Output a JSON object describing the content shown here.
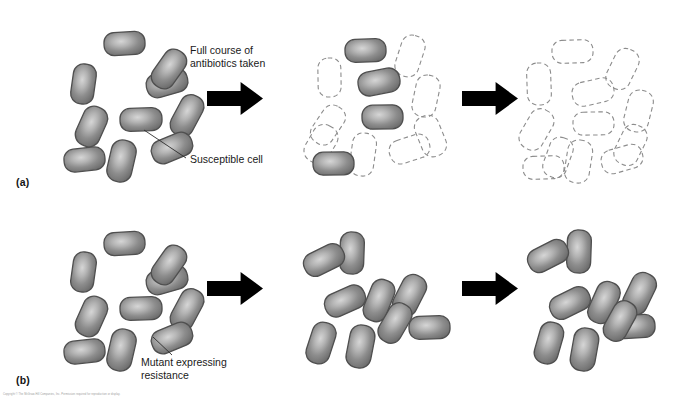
{
  "figure": {
    "width": 673,
    "height": 405,
    "background": "#ffffff",
    "credit_line": "Copyright © The McGraw-Hill Companies, Inc. Permission required for reproduction or display."
  },
  "colors": {
    "cell_fill_dark": "#6f6f6f",
    "cell_fill_light": "#c9c9c9",
    "cell_stroke": "#4f4f4f",
    "dead_cell_stroke": "#8c8c8c",
    "arrow_fill": "#000000",
    "leader_line": "#2b2b2b",
    "text": "#1a1a1a"
  },
  "labels": {
    "panel_a": "(a)",
    "panel_b": "(b)"
  },
  "captions": {
    "treatment": "Full course of\nantibiotics taken",
    "susceptible": "Susceptible cell",
    "mutant": "Mutant expressing\nresistance"
  },
  "icons": {
    "arrow": "right-arrow-icon",
    "live_cell": "bacterial-cell-icon",
    "dead_cell": "lysed-cell-outline-icon",
    "leader": "leader-line-icon"
  },
  "panels": [
    {
      "id": "a1",
      "row": "a",
      "stage": 1,
      "description": "Initial susceptible bacterial population",
      "live_count": 10,
      "dead_count": 0
    },
    {
      "id": "a2",
      "row": "a",
      "stage": 2,
      "description": "Most susceptible cells killed by antibiotic",
      "live_count": 4,
      "dead_count": 8
    },
    {
      "id": "a3",
      "row": "a",
      "stage": 3,
      "description": "Entire population eliminated",
      "live_count": 0,
      "dead_count": 12
    },
    {
      "id": "b1",
      "row": "b",
      "stage": 1,
      "description": "Population containing a resistant mutant",
      "live_count": 10,
      "dead_count": 0
    },
    {
      "id": "b2",
      "row": "b",
      "stage": 2,
      "description": "Resistant cells survive treatment",
      "live_count": 9,
      "dead_count": 0
    },
    {
      "id": "b3",
      "row": "b",
      "stage": 3,
      "description": "Resistant population regrows",
      "live_count": 9,
      "dead_count": 0
    }
  ],
  "cells": {
    "a1_live": [
      {
        "x": 104,
        "y": 32,
        "w": 41,
        "h": 23,
        "r": -3
      },
      {
        "x": 72,
        "y": 64,
        "w": 23,
        "h": 40,
        "r": 8
      },
      {
        "x": 146,
        "y": 71,
        "w": 42,
        "h": 24,
        "r": -16
      },
      {
        "x": 157,
        "y": 48,
        "w": 24,
        "h": 42,
        "r": 35
      },
      {
        "x": 175,
        "y": 94,
        "w": 24,
        "h": 43,
        "r": 28
      },
      {
        "x": 120,
        "y": 108,
        "w": 42,
        "h": 23,
        "r": -2
      },
      {
        "x": 79,
        "y": 106,
        "w": 25,
        "h": 41,
        "r": 24
      },
      {
        "x": 109,
        "y": 140,
        "w": 25,
        "h": 42,
        "r": 13
      },
      {
        "x": 64,
        "y": 148,
        "w": 41,
        "h": 23,
        "r": -6
      },
      {
        "x": 151,
        "y": 136,
        "w": 42,
        "h": 24,
        "r": -22
      }
    ],
    "a2_live": [
      {
        "x": 345,
        "y": 39,
        "w": 41,
        "h": 23,
        "r": -2
      },
      {
        "x": 358,
        "y": 70,
        "w": 42,
        "h": 24,
        "r": -11
      },
      {
        "x": 362,
        "y": 105,
        "w": 41,
        "h": 24,
        "r": -1
      },
      {
        "x": 313,
        "y": 152,
        "w": 41,
        "h": 23,
        "r": -1
      }
    ],
    "a2_dead": [
      {
        "x": 398,
        "y": 35,
        "w": 24,
        "h": 42,
        "r": 18
      },
      {
        "x": 318,
        "y": 58,
        "w": 23,
        "h": 39,
        "r": -1
      },
      {
        "x": 414,
        "y": 75,
        "w": 24,
        "h": 42,
        "r": 12
      },
      {
        "x": 316,
        "y": 104,
        "w": 24,
        "h": 42,
        "r": 34
      },
      {
        "x": 418,
        "y": 115,
        "w": 25,
        "h": 42,
        "r": -22
      },
      {
        "x": 351,
        "y": 133,
        "w": 24,
        "h": 43,
        "r": 8
      },
      {
        "x": 389,
        "y": 137,
        "w": 41,
        "h": 24,
        "r": -18
      },
      {
        "x": 308,
        "y": 124,
        "w": 26,
        "h": 40,
        "r": 30
      }
    ],
    "a3_dead": [
      {
        "x": 552,
        "y": 40,
        "w": 41,
        "h": 23,
        "r": -2
      },
      {
        "x": 610,
        "y": 48,
        "w": 25,
        "h": 42,
        "r": 26
      },
      {
        "x": 527,
        "y": 63,
        "w": 24,
        "h": 42,
        "r": -2
      },
      {
        "x": 572,
        "y": 80,
        "w": 42,
        "h": 24,
        "r": -13
      },
      {
        "x": 626,
        "y": 90,
        "w": 25,
        "h": 42,
        "r": 14
      },
      {
        "x": 573,
        "y": 112,
        "w": 41,
        "h": 23,
        "r": -1
      },
      {
        "x": 524,
        "y": 108,
        "w": 25,
        "h": 43,
        "r": 30
      },
      {
        "x": 618,
        "y": 124,
        "w": 25,
        "h": 42,
        "r": 26
      },
      {
        "x": 566,
        "y": 140,
        "w": 25,
        "h": 43,
        "r": 9
      },
      {
        "x": 601,
        "y": 147,
        "w": 42,
        "h": 24,
        "r": -16
      },
      {
        "x": 523,
        "y": 156,
        "w": 41,
        "h": 23,
        "r": -2
      },
      {
        "x": 546,
        "y": 137,
        "w": 24,
        "h": 41,
        "r": 20
      }
    ],
    "b1_live": [
      {
        "x": 104,
        "y": 232,
        "w": 41,
        "h": 23,
        "r": -3
      },
      {
        "x": 72,
        "y": 252,
        "w": 23,
        "h": 40,
        "r": 8
      },
      {
        "x": 146,
        "y": 268,
        "w": 42,
        "h": 24,
        "r": -16
      },
      {
        "x": 157,
        "y": 244,
        "w": 24,
        "h": 42,
        "r": 35
      },
      {
        "x": 175,
        "y": 288,
        "w": 24,
        "h": 43,
        "r": 28
      },
      {
        "x": 120,
        "y": 297,
        "w": 42,
        "h": 23,
        "r": -2
      },
      {
        "x": 79,
        "y": 296,
        "w": 25,
        "h": 41,
        "r": 24
      },
      {
        "x": 109,
        "y": 329,
        "w": 25,
        "h": 42,
        "r": 13
      },
      {
        "x": 64,
        "y": 340,
        "w": 41,
        "h": 23,
        "r": -6
      },
      {
        "x": 151,
        "y": 326,
        "w": 42,
        "h": 24,
        "r": -22
      }
    ],
    "b2_live": [
      {
        "x": 340,
        "y": 232,
        "w": 24,
        "h": 42,
        "r": 2
      },
      {
        "x": 303,
        "y": 248,
        "w": 42,
        "h": 24,
        "r": -26
      },
      {
        "x": 367,
        "y": 279,
        "w": 24,
        "h": 43,
        "r": 22
      },
      {
        "x": 397,
        "y": 274,
        "w": 25,
        "h": 43,
        "r": 27
      },
      {
        "x": 324,
        "y": 289,
        "w": 42,
        "h": 24,
        "r": -24
      },
      {
        "x": 409,
        "y": 316,
        "w": 41,
        "h": 23,
        "r": -2
      },
      {
        "x": 309,
        "y": 322,
        "w": 24,
        "h": 42,
        "r": 18
      },
      {
        "x": 348,
        "y": 325,
        "w": 25,
        "h": 43,
        "r": 11
      },
      {
        "x": 383,
        "y": 302,
        "w": 24,
        "h": 42,
        "r": 30
      }
    ],
    "b3_live": [
      {
        "x": 567,
        "y": 230,
        "w": 24,
        "h": 43,
        "r": 2
      },
      {
        "x": 527,
        "y": 244,
        "w": 42,
        "h": 24,
        "r": -27
      },
      {
        "x": 592,
        "y": 281,
        "w": 24,
        "h": 43,
        "r": 24
      },
      {
        "x": 627,
        "y": 272,
        "w": 25,
        "h": 43,
        "r": 26
      },
      {
        "x": 549,
        "y": 291,
        "w": 42,
        "h": 24,
        "r": -26
      },
      {
        "x": 614,
        "y": 315,
        "w": 41,
        "h": 23,
        "r": -3
      },
      {
        "x": 537,
        "y": 322,
        "w": 24,
        "h": 42,
        "r": 16
      },
      {
        "x": 572,
        "y": 328,
        "w": 25,
        "h": 43,
        "r": 10
      },
      {
        "x": 608,
        "y": 300,
        "w": 24,
        "h": 42,
        "r": 29
      }
    ]
  },
  "arrows": [
    {
      "id": "arrow-a1",
      "x": 207,
      "y": 82,
      "w": 56,
      "h": 33
    },
    {
      "id": "arrow-a2",
      "x": 462,
      "y": 82,
      "w": 56,
      "h": 33
    },
    {
      "id": "arrow-a3",
      "x": 207,
      "y": 272,
      "w": 56,
      "h": 33
    },
    {
      "id": "arrow-b2",
      "x": 462,
      "y": 272,
      "w": 56,
      "h": 33
    }
  ],
  "leaders": [
    {
      "id": "leader-susceptible",
      "x1": 144,
      "y1": 130,
      "x2": 186,
      "y2": 158
    },
    {
      "id": "leader-mutant",
      "x1": 153,
      "y1": 337,
      "x2": 172,
      "y2": 355
    }
  ]
}
